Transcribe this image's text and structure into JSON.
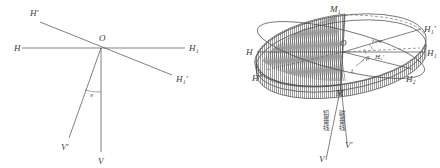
{
  "figure": {
    "title": "",
    "background_color": "#ffffff",
    "ink_color": "#4a4a4a",
    "panels": [
      {
        "id": "left-panel",
        "name": "plane-deviation-diagram",
        "description": "Two crossing axes through origin O with vertical and deflected vertical lines",
        "labels": {
          "origin": "O",
          "h_left": "H",
          "h_right": "H₁",
          "h_prime_upper_left": "H′",
          "h_prime_lower_right": "H₁′",
          "v_bottom": "V",
          "v_prime_bottom_left": "V′",
          "angle": "v"
        }
      },
      {
        "id": "right-panel",
        "name": "ellipse-horizon-diagram",
        "description": "Three-dimensional disk / ellipse horizon plane with hatched sector, magnetic meridian and plumb line",
        "labels": {
          "origin": "O",
          "m_top": "M₁",
          "m_bottom": "M",
          "h_left": "H",
          "h_double_prime_left": "H″",
          "h1_prime_right": "H₁′",
          "h1_right": "H₁",
          "h2_right": "H₂",
          "h2_inner": "H₂′",
          "v_bottom": "V",
          "v_prime_bottom": "V′",
          "angle_i_equals_v": "i=v",
          "angle_beta": "β",
          "angle_i_v": "iᵥ",
          "cjk_plumb_line": "铅垂线",
          "cjk_magnetic_vertical": "磁垂线"
        }
      }
    ]
  }
}
